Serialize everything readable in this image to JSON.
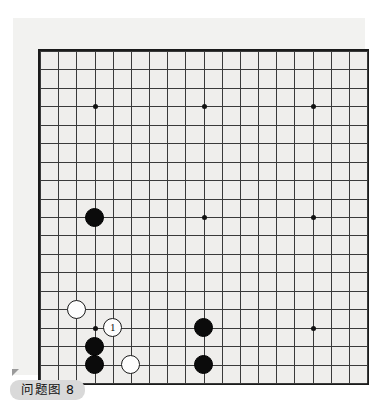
{
  "figure": {
    "caption": "问题图 8",
    "caption_marker": "corner-triangle"
  },
  "board": {
    "size": 19,
    "grid_columns": 19,
    "grid_rows": 19,
    "background_color": "#efeeec",
    "line_color": "#3a3a3a",
    "border_color": "#1b1b1b",
    "star_points": [
      {
        "col": 4,
        "row": 4
      },
      {
        "col": 10,
        "row": 4
      },
      {
        "col": 16,
        "row": 4
      },
      {
        "col": 4,
        "row": 10
      },
      {
        "col": 10,
        "row": 10
      },
      {
        "col": 16,
        "row": 10
      },
      {
        "col": 4,
        "row": 16
      },
      {
        "col": 10,
        "row": 16
      },
      {
        "col": 16,
        "row": 16
      }
    ],
    "stones": [
      {
        "color": "black",
        "col": 4,
        "row": 10,
        "label": ""
      },
      {
        "color": "white",
        "col": 3,
        "row": 15,
        "label": ""
      },
      {
        "color": "white",
        "col": 5,
        "row": 16,
        "label": "1"
      },
      {
        "color": "black",
        "col": 4,
        "row": 17,
        "label": ""
      },
      {
        "color": "black",
        "col": 4,
        "row": 18,
        "label": ""
      },
      {
        "color": "white",
        "col": 6,
        "row": 18,
        "label": ""
      },
      {
        "color": "black",
        "col": 10,
        "row": 16,
        "label": ""
      },
      {
        "color": "black",
        "col": 10,
        "row": 18,
        "label": ""
      }
    ]
  },
  "colors": {
    "page_background": "#ffffff",
    "panel_background": "#f2f2f0",
    "black_stone": "#0b0b0b",
    "white_stone": "#fdfdfd",
    "caption_background": "#d9d9d9",
    "caption_text": "#111111"
  }
}
